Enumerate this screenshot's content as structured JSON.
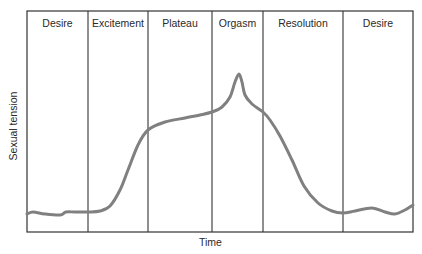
{
  "chart_data": {
    "type": "line",
    "title": "",
    "xlabel": "Time",
    "ylabel": "Sexual tension",
    "grid": false,
    "legend": null,
    "phases": [
      {
        "label": "Desire",
        "x_start": 27,
        "x_end": 88
      },
      {
        "label": "Excitement",
        "x_start": 88,
        "x_end": 148
      },
      {
        "label": "Plateau",
        "x_start": 148,
        "x_end": 212
      },
      {
        "label": "Orgasm",
        "x_start": 212,
        "x_end": 263
      },
      {
        "label": "Resolution",
        "x_start": 263,
        "x_end": 343
      },
      {
        "label": "Desire",
        "x_start": 343,
        "x_end": 413
      }
    ],
    "frame": {
      "left": 27,
      "top": 11,
      "right": 413,
      "bottom": 232
    },
    "curve_color": "#808080",
    "frame_color": "#333333",
    "series": [
      {
        "name": "Sexual tension",
        "points": [
          [
            27,
            214
          ],
          [
            33,
            212
          ],
          [
            45,
            214
          ],
          [
            60,
            215
          ],
          [
            66,
            212
          ],
          [
            75,
            212
          ],
          [
            88,
            212
          ],
          [
            100,
            211
          ],
          [
            110,
            206
          ],
          [
            120,
            190
          ],
          [
            128,
            170
          ],
          [
            138,
            145
          ],
          [
            148,
            130
          ],
          [
            165,
            122
          ],
          [
            185,
            118
          ],
          [
            200,
            115
          ],
          [
            212,
            112
          ],
          [
            222,
            107
          ],
          [
            230,
            97
          ],
          [
            235,
            82
          ],
          [
            239,
            74
          ],
          [
            242,
            82
          ],
          [
            245,
            95
          ],
          [
            252,
            104
          ],
          [
            263,
            112
          ],
          [
            270,
            120
          ],
          [
            280,
            136
          ],
          [
            292,
            160
          ],
          [
            304,
            186
          ],
          [
            318,
            203
          ],
          [
            332,
            211
          ],
          [
            343,
            213
          ],
          [
            355,
            211
          ],
          [
            372,
            208
          ],
          [
            385,
            212
          ],
          [
            395,
            214
          ],
          [
            405,
            210
          ],
          [
            413,
            205
          ]
        ]
      }
    ]
  }
}
